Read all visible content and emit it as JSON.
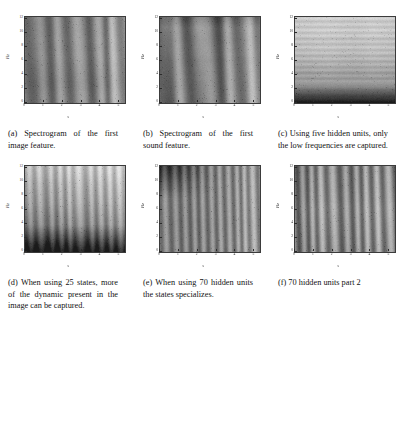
{
  "figure": {
    "layout": "2x3-grid",
    "rows": [
      [
        "a",
        "b",
        "c"
      ],
      [
        "d",
        "e",
        "f"
      ]
    ]
  },
  "axes": {
    "xlabel": "s",
    "ylabel": "Hz",
    "xticks": [
      "0",
      "1",
      "2",
      "3",
      "4",
      "5"
    ],
    "yticks": [
      "0",
      "2",
      "4",
      "6",
      "8",
      "10",
      "12"
    ],
    "xlim": [
      0,
      5.3
    ],
    "ylim": [
      0,
      12.3
    ]
  },
  "subfigures": [
    {
      "id": "a",
      "label": "(a)",
      "caption": "(a) Spectrogram of the first image feature.",
      "caption_text": "Spectrogram of the first image feature.",
      "pattern": "vertical-streaks-dark-columns",
      "seed": 11
    },
    {
      "id": "b",
      "label": "(b)",
      "caption": "(b) Spectrogram of the first sound feature.",
      "caption_text": "Spectrogram of the first sound feature.",
      "pattern": "strong-vertical-bands",
      "seed": 27
    },
    {
      "id": "c",
      "label": "(c)",
      "caption": "(c) Using five hidden units, only the low frequencies are captured.",
      "caption_text": "Using five hidden units, only the low frequencies are captured.",
      "pattern": "horizontal-bands-dark-bottom",
      "seed": 43
    },
    {
      "id": "d",
      "label": "(d)",
      "caption": "(d) When using 25 states, more of the dynamic present in the image can be captured.",
      "caption_text": "When using 25 states, more of the dynamic present in the image can be captured.",
      "pattern": "fine-vertical-dark-bottom",
      "seed": 59
    },
    {
      "id": "e",
      "label": "(e)",
      "caption": "(e) When using 70 hidden units the states specializes.",
      "caption_text": "When using 70 hidden units the states specializes.",
      "pattern": "fine-vertical-dark-topleft",
      "seed": 73
    },
    {
      "id": "f",
      "label": "(f)",
      "caption": "(f) 70 hidden units part 2",
      "caption_text": "70 hidden units part 2",
      "pattern": "fine-vertical-high-contrast",
      "seed": 91
    }
  ],
  "colors": {
    "page_background": "#ffffff",
    "text": "#121212",
    "axis_line": "#3b3b3b",
    "colormap": "grayscale"
  }
}
